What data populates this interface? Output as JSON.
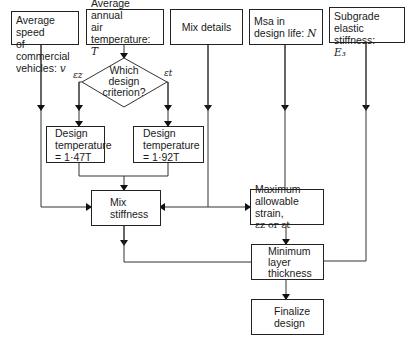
{
  "diagram": {
    "inputs": {
      "speed": {
        "line1": "Average speed",
        "line2": "of commercial",
        "line3": "vehicles:",
        "var": "v"
      },
      "temperature": {
        "line1": "Average annual",
        "line2": "air temperature:",
        "var": "T"
      },
      "mix_details": {
        "label": "Mix details"
      },
      "msa": {
        "line1": "Msa in",
        "line2": "design life:",
        "var": "N"
      },
      "subgrade": {
        "line1": "Subgrade",
        "line2": "elastic stiffness:",
        "var": "E₃"
      }
    },
    "decision": {
      "line1": "Which",
      "line2": "design",
      "line3": "criterion?",
      "left_label": "εz",
      "right_label": "εt"
    },
    "design_temp_left": {
      "line1": "Design",
      "line2": "temperature",
      "line3": "= 1·47T"
    },
    "design_temp_right": {
      "line1": "Design",
      "line2": "temperature",
      "line3": "= 1·92T"
    },
    "mix_stiffness": {
      "line1": "Mix",
      "line2": "stiffness"
    },
    "max_strain": {
      "line1": "Maximum",
      "line2": "allowable strain,",
      "line3": "εz or εt"
    },
    "min_thickness": {
      "line1": "Minimum",
      "line2": "layer",
      "line3": "thickness"
    },
    "finalize": {
      "line1": "Finalize",
      "line2": "design"
    }
  }
}
